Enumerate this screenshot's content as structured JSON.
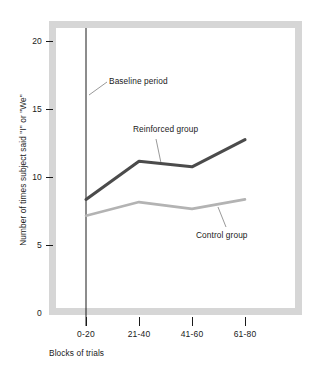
{
  "chart_data": {
    "type": "line",
    "title": "",
    "xlabel": "Blocks of trials",
    "ylabel": "Number of times subject said \"I\" or \"We\"",
    "categories": [
      "0-20",
      "21-40",
      "41-60",
      "61-80"
    ],
    "yticks": [
      0,
      5,
      10,
      15,
      20
    ],
    "ylim": [
      0,
      21.5
    ],
    "grid": false,
    "legend_position": "inline-annotations",
    "series": [
      {
        "name": "Reinforced group",
        "values": [
          8.5,
          11.3,
          10.9,
          12.9
        ],
        "color": "#4b4b4b",
        "width": 3.1
      },
      {
        "name": "Control group",
        "values": [
          7.3,
          8.3,
          7.8,
          8.5
        ],
        "color": "#b3b3b3",
        "width": 2.6
      }
    ],
    "annotations": [
      {
        "label": "Baseline period",
        "note": "vertical rule marking the baseline period at the first block"
      },
      {
        "label": "Reinforced group",
        "note": "leader line to the dark upper curve"
      },
      {
        "label": "Control group",
        "note": "leader line to the light lower curve"
      }
    ]
  },
  "axes": {
    "ytick_labels": [
      "20",
      "15",
      "10",
      "5",
      "0"
    ],
    "xtick_labels": [
      "0-20",
      "21-40",
      "41-60",
      "61-80"
    ],
    "ylabel": "Number of times subject said \"I\" or \"We\"",
    "xlabel": "Blocks of trials"
  },
  "annotations": {
    "baseline": "Baseline period",
    "reinforced": "Reinforced group",
    "control": "Control group"
  },
  "colors": {
    "frame": "#d6d6d6",
    "reinforced": "#4b4b4b",
    "control": "#b3b3b3",
    "axis": "#1a1a1a",
    "background": "#ffffff"
  }
}
